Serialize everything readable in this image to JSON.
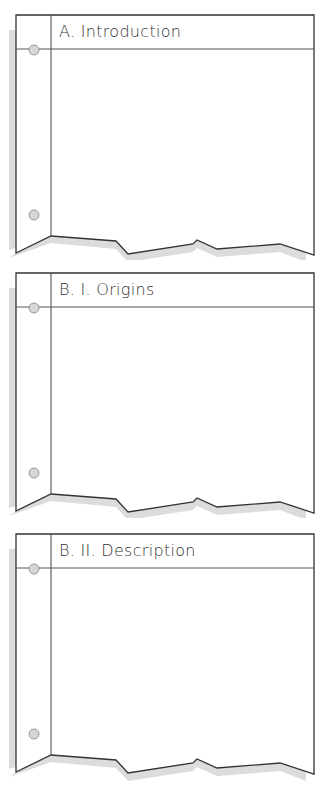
{
  "panels": [
    {
      "id": "A",
      "title": "A.  Introduction",
      "top": 15
    },
    {
      "id": "B1",
      "title": "B. I.  Origins",
      "top": 273
    },
    {
      "id": "B2",
      "title": "B. II.  Description",
      "top": 534
    }
  ],
  "colors": {
    "line": "#333333",
    "shadow": "#d9d9d9",
    "hole_fill": "#d6d6d6",
    "hole_stroke": "#999999"
  }
}
